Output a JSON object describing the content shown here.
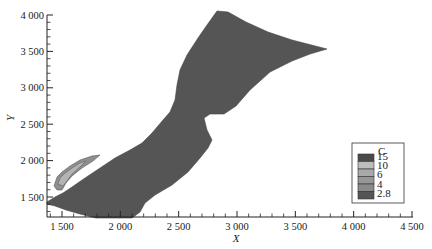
{
  "chart_data": {
    "type": "heatmap",
    "subtype": "filled contour map",
    "title": "",
    "xlabel": "X",
    "ylabel": "Y",
    "xlim": [
      1400,
      4500
    ],
    "ylim": [
      1250,
      4000
    ],
    "x_ticks": [
      1500,
      2000,
      2500,
      3000,
      3500,
      4000,
      4500
    ],
    "x_tick_labels": [
      "1 500",
      "2 000",
      "2 500",
      "3 000",
      "3 500",
      "4 000",
      "4 500"
    ],
    "y_ticks": [
      1500,
      2000,
      2500,
      3000,
      3500,
      4000
    ],
    "y_tick_labels": [
      "1 500",
      "2 000",
      "2 500",
      "3 000",
      "3 500",
      "4 000"
    ],
    "grid": false,
    "legend": {
      "title": "C",
      "position": "lower right",
      "levels": [
        15,
        10,
        6,
        4,
        2.8
      ],
      "level_labels": [
        "15",
        "10",
        "6",
        "4",
        "2.8"
      ],
      "colors": [
        "#4a4a4a",
        "#bdbdbd",
        "#a9a9a9",
        "#979797",
        "#8a8a8a",
        "#555555"
      ]
    },
    "regions": [
      {
        "level": "< 2.8",
        "description": "dominant domain fill",
        "color": "#555555"
      },
      {
        "level": "2.8 - 4",
        "description": "thin band near left shore at X~1550-1800, Y~1650-1950",
        "color": "#8a8a8a"
      },
      {
        "level": "4 - 6",
        "description": "small patch near X~1550-1700, Y~1700-1850",
        "color": "#a9a9a9"
      }
    ],
    "domain_outline_xy": [
      [
        1400,
        1350
      ],
      [
        1470,
        1420
      ],
      [
        1560,
        1510
      ],
      [
        1680,
        1680
      ],
      [
        1820,
        1890
      ],
      [
        1990,
        2040
      ],
      [
        2110,
        2190
      ],
      [
        2230,
        2430
      ],
      [
        2330,
        2580
      ],
      [
        2400,
        2800
      ],
      [
        2450,
        3080
      ],
      [
        2520,
        3370
      ],
      [
        2640,
        3660
      ],
      [
        2800,
        3950
      ],
      [
        2950,
        3960
      ],
      [
        3150,
        3810
      ],
      [
        3450,
        3660
      ],
      [
        3750,
        3520
      ],
      [
        3550,
        3430
      ],
      [
        3250,
        3170
      ],
      [
        3070,
        2860
      ],
      [
        2920,
        2640
      ],
      [
        2650,
        2590
      ],
      [
        2570,
        2490
      ],
      [
        2610,
        2290
      ],
      [
        2450,
        2020
      ],
      [
        2260,
        1820
      ],
      [
        2130,
        1570
      ],
      [
        2140,
        1360
      ],
      [
        2040,
        1280
      ],
      [
        1840,
        1220
      ],
      [
        1710,
        1260
      ],
      [
        1560,
        1360
      ],
      [
        1400,
        1350
      ]
    ]
  }
}
